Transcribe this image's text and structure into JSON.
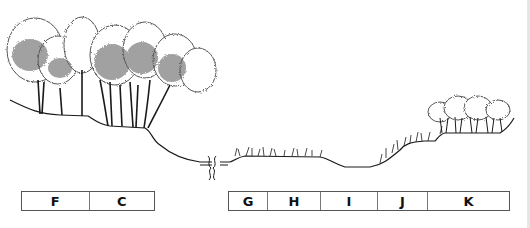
{
  "diagram": {
    "type": "vegetation-zonation-profile",
    "zone_groups": [
      {
        "id": "left",
        "zones": [
          {
            "label": "F",
            "width": 67
          },
          {
            "label": "C",
            "width": 66
          }
        ]
      },
      {
        "id": "right",
        "zones": [
          {
            "label": "G",
            "width": 38
          },
          {
            "label": "H",
            "width": 53
          },
          {
            "label": "I",
            "width": 57
          },
          {
            "label": "J",
            "width": 50
          },
          {
            "label": "K",
            "width": 83
          }
        ]
      }
    ],
    "colors": {
      "ink": "#1a1a1a",
      "box_border": "#555555"
    }
  }
}
